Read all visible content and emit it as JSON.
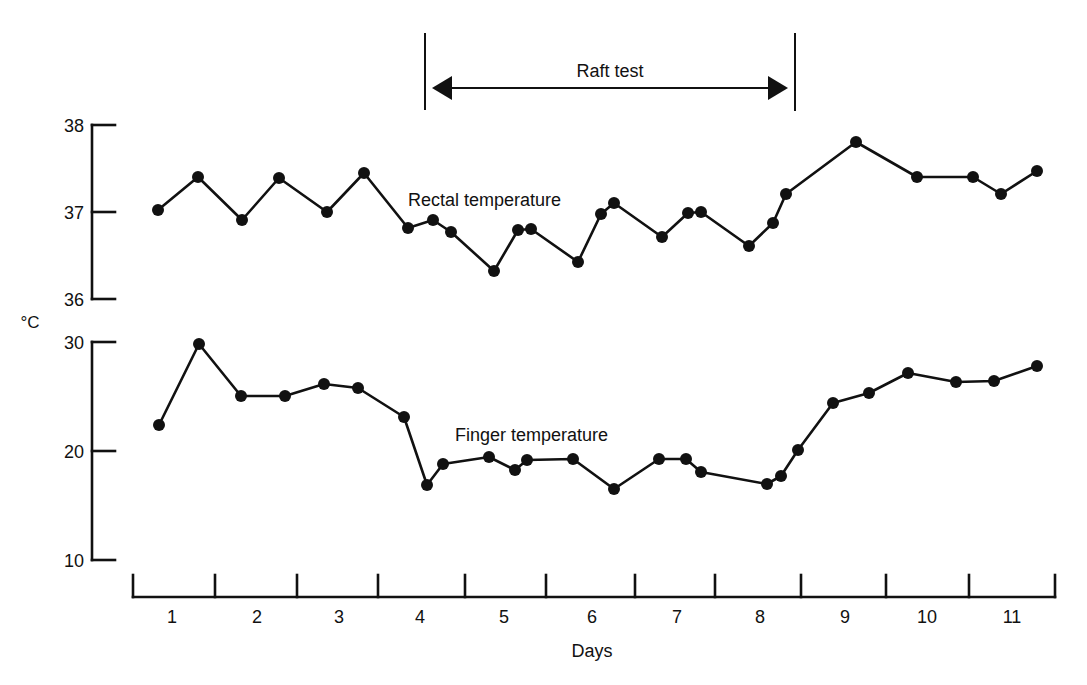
{
  "chart_data": {
    "type": "line",
    "title": "",
    "xlabel": "Days",
    "ylabel": "°C",
    "grid": false,
    "annotation": {
      "label": "Raft test",
      "x_start_day": 4.1,
      "x_end_day": 8.55,
      "x_start_px": 425,
      "x_end_px": 795
    },
    "x_axis": {
      "label": "Days",
      "categories": [
        "1",
        "2",
        "3",
        "4",
        "5",
        "6",
        "7",
        "8",
        "9",
        "10",
        "11"
      ],
      "tick_px": [
        133,
        215,
        297,
        378,
        465,
        546,
        635,
        715,
        801,
        886,
        969,
        1055
      ],
      "label_center_px": [
        172,
        257,
        339,
        420,
        504,
        592,
        677,
        760,
        845,
        927,
        1012
      ],
      "y_px": 597
    },
    "panels": [
      {
        "name": "rectal",
        "axis_ticks": [
          38,
          37,
          36
        ],
        "ylim": [
          36,
          38
        ],
        "y_px_top": 125,
        "y_px_bottom": 299,
        "series_label": "Rectal temperature",
        "label_px": [
          408,
          206
        ]
      },
      {
        "name": "finger",
        "axis_ticks": [
          30,
          20,
          10
        ],
        "ylim": [
          10,
          30
        ],
        "y_px_top": 342,
        "y_px_bottom": 560,
        "series_label": "Finger temperature",
        "label_px": [
          455,
          441
        ]
      }
    ],
    "series": [
      {
        "name": "Rectal temperature",
        "panel": 0,
        "x": [
          0.53,
          1.01,
          1.54,
          1.99,
          2.57,
          3.02,
          3.53,
          3.83,
          4.04,
          4.56,
          4.85,
          5.01,
          5.57,
          5.85,
          6.01,
          6.54,
          6.86,
          7.02,
          7.59,
          7.88,
          8.04,
          8.9,
          9.64,
          10.31,
          10.65,
          11.08
        ],
        "values": [
          37.0,
          37.38,
          36.88,
          37.37,
          36.98,
          37.43,
          36.81,
          36.9,
          36.76,
          36.32,
          36.79,
          36.8,
          36.42,
          36.97,
          37.1,
          36.7,
          36.98,
          36.99,
          36.61,
          36.87,
          37.2,
          37.79,
          37.39,
          37.39,
          37.19,
          37.46
        ]
      },
      {
        "name": "Finger temperature",
        "panel": 1,
        "x": [
          0.53,
          1.02,
          1.53,
          2.06,
          2.53,
          2.95,
          3.49,
          3.77,
          3.96,
          4.52,
          4.83,
          4.98,
          5.53,
          6.02,
          6.56,
          6.89,
          7.07,
          7.86,
          8.03,
          8.24,
          8.64,
          9.07,
          9.54,
          10.12,
          10.57,
          11.09
        ],
        "values": [
          22.5,
          29.9,
          25.1,
          25.1,
          26.2,
          25.8,
          23.2,
          17.0,
          18.9,
          19.5,
          18.3,
          19.3,
          19.4,
          16.6,
          19.4,
          19.3,
          18.1,
          17.1,
          17.8,
          20.2,
          24.5,
          25.4,
          27.2,
          26.4,
          26.5,
          27.9
        ]
      }
    ],
    "px_points": {
      "rectal": [
        [
          158,
          210
        ],
        [
          198,
          177
        ],
        [
          242,
          220
        ],
        [
          279,
          178
        ],
        [
          327,
          212
        ],
        [
          364,
          173
        ],
        [
          408,
          228
        ],
        [
          433,
          220
        ],
        [
          451,
          232
        ],
        [
          494,
          271
        ],
        [
          518,
          230
        ],
        [
          531,
          229
        ],
        [
          578,
          262
        ],
        [
          601,
          214
        ],
        [
          614,
          203
        ],
        [
          662,
          237
        ],
        [
          688,
          213
        ],
        [
          701,
          212
        ],
        [
          749,
          246
        ],
        [
          773,
          223
        ],
        [
          786,
          194
        ],
        [
          856,
          142
        ],
        [
          917,
          177
        ],
        [
          973,
          177
        ],
        [
          1001,
          194
        ],
        [
          1037,
          171
        ]
      ],
      "finger": [
        [
          159,
          425
        ],
        [
          199,
          344
        ],
        [
          241,
          396
        ],
        [
          285,
          396
        ],
        [
          324,
          384
        ],
        [
          358,
          388
        ],
        [
          404,
          417
        ],
        [
          427,
          485
        ],
        [
          443,
          464
        ],
        [
          489,
          457
        ],
        [
          515,
          470
        ],
        [
          527,
          460
        ],
        [
          573,
          459
        ],
        [
          614,
          489
        ],
        [
          659,
          459
        ],
        [
          686,
          459
        ],
        [
          701,
          472
        ],
        [
          767,
          484
        ],
        [
          781,
          476
        ],
        [
          798,
          450
        ],
        [
          833,
          403
        ],
        [
          869,
          393
        ],
        [
          908,
          373
        ],
        [
          956,
          382
        ],
        [
          994,
          381
        ],
        [
          1037,
          366
        ]
      ]
    },
    "ylabel_px": [
      30,
      328
    ],
    "xlabel_px": [
      592,
      657
    ]
  }
}
